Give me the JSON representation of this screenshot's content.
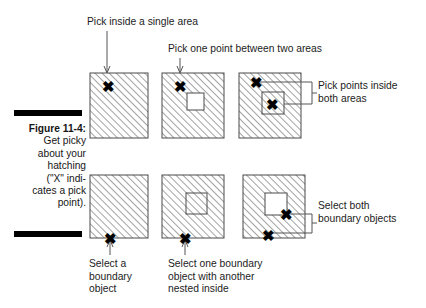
{
  "figure": {
    "label": "Figure 11-4:",
    "caption_lines": [
      "Get picky",
      "about your",
      "hatching",
      "(\"X\" indi-",
      "cates a pick",
      "point)."
    ],
    "rule_color": "#000000"
  },
  "annotations": {
    "top_left": "Pick inside a single area",
    "top_middle": "Pick one point between two areas",
    "right_top": "Pick points inside\nboth areas",
    "right_bottom": "Select both\nboundary objects",
    "bottom_left": "Select a\nboundary\nobject",
    "bottom_middle": "Select one boundary\nobject with another\nnested inside"
  },
  "marker": {
    "glyph": "✖",
    "name": "pick-point-x"
  },
  "colors": {
    "hatch_line": "#555555",
    "outline": "#4a4a4a",
    "leader": "#555555",
    "text": "#1c1c1c",
    "white_fill": "#ffffff"
  },
  "diagram": {
    "top_row": [
      {
        "id": "top-square-1",
        "outer": {
          "x": 90,
          "y": 73,
          "w": 58,
          "h": 65,
          "fill": "hatched"
        },
        "inner": null,
        "picks": [
          {
            "x": 108,
            "y": 86
          }
        ]
      },
      {
        "id": "top-square-2",
        "outer": {
          "x": 162,
          "y": 73,
          "w": 62,
          "h": 65,
          "fill": "hatched"
        },
        "inner": {
          "x": 187,
          "y": 93,
          "w": 17,
          "h": 17,
          "fill": "white"
        },
        "picks": [
          {
            "x": 180,
            "y": 86
          }
        ]
      },
      {
        "id": "top-square-3",
        "outer": {
          "x": 239,
          "y": 73,
          "w": 62,
          "h": 65,
          "fill": "hatched"
        },
        "inner": {
          "x": 262,
          "y": 92,
          "w": 22,
          "h": 22,
          "fill": "hatched"
        },
        "picks": [
          {
            "x": 256,
            "y": 82
          },
          {
            "x": 272,
            "y": 104
          }
        ]
      }
    ],
    "bottom_row": [
      {
        "id": "bottom-square-1",
        "outer": {
          "x": 90,
          "y": 175,
          "w": 58,
          "h": 63,
          "fill": "hatched"
        },
        "inner": null,
        "picks": [
          {
            "x": 110,
            "y": 238
          }
        ]
      },
      {
        "id": "bottom-square-2",
        "outer": {
          "x": 162,
          "y": 175,
          "w": 62,
          "h": 63,
          "fill": "hatched"
        },
        "inner": {
          "x": 186,
          "y": 193,
          "w": 21,
          "h": 21,
          "fill": "hatched"
        },
        "picks": [
          {
            "x": 185,
            "y": 238
          }
        ]
      },
      {
        "id": "bottom-square-3",
        "outer": {
          "x": 243,
          "y": 175,
          "w": 62,
          "h": 63,
          "fill": "hatched"
        },
        "inner": {
          "x": 265,
          "y": 193,
          "w": 22,
          "h": 22,
          "fill": "white"
        },
        "picks": [
          {
            "x": 286,
            "y": 214
          },
          {
            "x": 268,
            "y": 235
          }
        ]
      }
    ]
  }
}
